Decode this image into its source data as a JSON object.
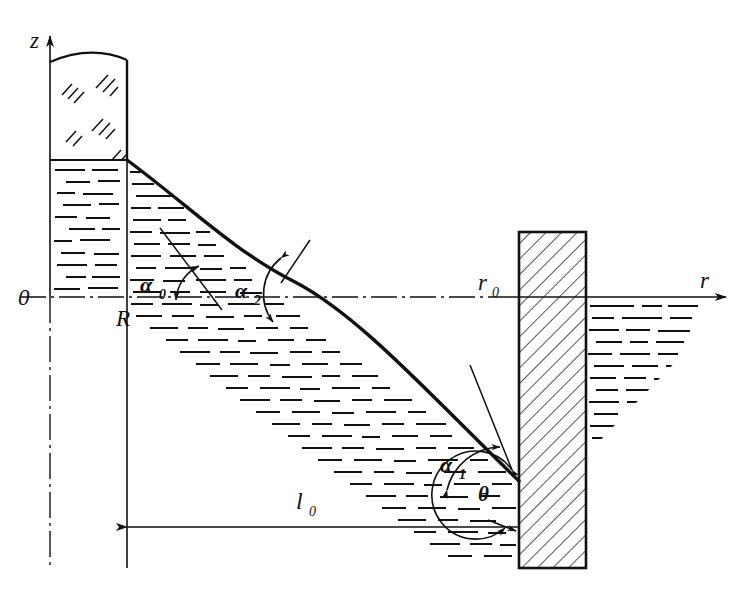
{
  "figure": {
    "background": "#ffffff",
    "ink": "#111111",
    "width": 751,
    "height": 600
  },
  "axes": {
    "vertical": {
      "label": "z",
      "name": "z-axis",
      "x": 50,
      "top": 28,
      "bottom": 570,
      "arrow": "up"
    },
    "horizontal": {
      "label": "r",
      "name": "r-axis",
      "y": 297,
      "left": 20,
      "right": 735,
      "arrow": "right"
    },
    "origin_label": "0",
    "origin_x": 22,
    "origin_y": 297
  },
  "markers": {
    "R": {
      "label": "R",
      "description": "inner container radius / left boundary of free surface",
      "x": 127,
      "label_x": 116,
      "label_y": 324
    },
    "r0": {
      "label": "r",
      "sub": "0",
      "description": "radius at the wetted wall",
      "x": 519,
      "label_x": 478,
      "label_y": 290
    },
    "l0": {
      "label": "l",
      "sub": "0",
      "description": "horizontal span from R to the wall",
      "line_y": 527,
      "from_x": 127,
      "to_x": 519,
      "label_x": 300,
      "label_y": 508
    }
  },
  "angles": [
    {
      "id": "alpha0",
      "label": "α",
      "sub": "0",
      "description": "tangent angle of the free surface at r = R",
      "label_x": 140,
      "label_y": 292
    },
    {
      "id": "alpha2",
      "label": "α",
      "sub": "2",
      "description": "tangent angle at the inflection point of the meniscus",
      "label_x": 235,
      "label_y": 298
    },
    {
      "id": "alpha1",
      "label": "α",
      "sub": "1",
      "description": "tangent angle of the free surface at the wall",
      "label_x": 440,
      "label_y": 472
    },
    {
      "id": "theta",
      "label": "θ",
      "sub": "",
      "description": "contact angle between liquid surface and wall",
      "label_x": 478,
      "label_y": 501
    }
  ],
  "regions": [
    {
      "name": "gas-region",
      "description": "gas / vapour above the liquid in the central container, drawn with short diagonal tick clusters",
      "hatch": "diagonal-ticks"
    },
    {
      "name": "liquid-region-left",
      "description": "liquid column inside the central container, drawn with horizontal dashes",
      "hatch": "horizontal-dashes"
    },
    {
      "name": "liquid-region-main",
      "description": "liquid bulk under the meniscus curve between R and the wall",
      "hatch": "horizontal-dashes"
    },
    {
      "name": "liquid-region-right",
      "description": "liquid to the right of the wall below the r-axis",
      "hatch": "horizontal-dashes"
    },
    {
      "name": "wall",
      "description": "solid vertical wall in cross-section with 45-degree hatching",
      "hatch": "diagonal-45",
      "x": 519,
      "y": 232,
      "width": 67,
      "height": 336
    }
  ],
  "curve": {
    "name": "meniscus-free-surface",
    "description": "S-shaped free surface from the container lip at R down to the wall contact point",
    "start": [
      127,
      160
    ],
    "inflection": [
      295,
      282
    ],
    "end": [
      519,
      481
    ]
  }
}
